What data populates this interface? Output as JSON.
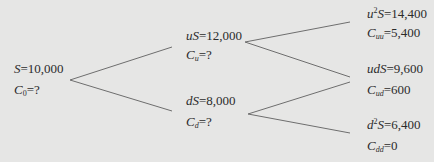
{
  "diagram": {
    "type": "binomial-tree",
    "title": "",
    "colors": {
      "background": "#e6e6e5",
      "line": "#6e6e6e",
      "text": "#2b2b2b"
    },
    "nodes": {
      "root": {
        "price_symbol": "S",
        "price_value": "10,000",
        "option_symbol": "C",
        "option_sub": "0",
        "option_value": "?"
      },
      "up": {
        "price_prefix": "u",
        "price_symbol": "S",
        "price_value": "12,000",
        "option_symbol": "C",
        "option_sub": "u",
        "option_value": "?"
      },
      "down": {
        "price_prefix": "d",
        "price_symbol": "S",
        "price_value": "8,000",
        "option_symbol": "C",
        "option_sub": "d",
        "option_value": "?"
      },
      "up_up": {
        "price_prefix": "u",
        "price_sup": "2",
        "price_symbol": "S",
        "price_value": "14,400",
        "option_symbol": "C",
        "option_sub": "uu",
        "option_value": "5,400"
      },
      "up_down": {
        "price_prefix": "ud",
        "price_symbol": "S",
        "price_value": "9,600",
        "option_symbol": "C",
        "option_sub": "ud",
        "option_value": "600"
      },
      "down_down": {
        "price_prefix": "d",
        "price_sup": "2",
        "price_symbol": "S",
        "price_value": "6,400",
        "option_symbol": "C",
        "option_sub": "dd",
        "option_value": "0"
      }
    },
    "edges": [
      {
        "from": "root",
        "to": "up"
      },
      {
        "from": "root",
        "to": "down"
      },
      {
        "from": "up",
        "to": "up_up"
      },
      {
        "from": "up",
        "to": "up_down"
      },
      {
        "from": "down",
        "to": "up_down"
      },
      {
        "from": "down",
        "to": "down_down"
      }
    ],
    "equals_sign": "="
  }
}
